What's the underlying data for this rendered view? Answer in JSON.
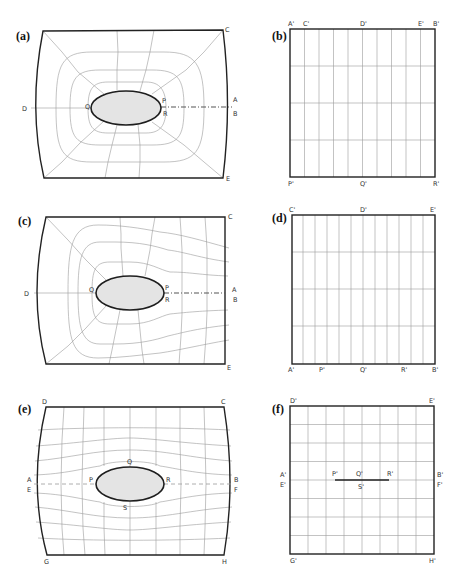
{
  "figure": {
    "panels": [
      {
        "id": "a",
        "label": "(a)",
        "type": "physical-domain",
        "points": {
          "C": "C",
          "D": "D",
          "A": "A",
          "B": "B",
          "E": "E",
          "P": "P",
          "Q": "Q",
          "R": "R"
        }
      },
      {
        "id": "b",
        "label": "(b)",
        "type": "computational-domain",
        "points": {
          "A": "A'",
          "C": "C'",
          "D": "D'",
          "E": "E'",
          "B": "B'",
          "P": "P'",
          "Q": "Q'",
          "R": "R'"
        },
        "grid": {
          "columns": 10,
          "rows": 4
        }
      },
      {
        "id": "c",
        "label": "(c)",
        "type": "physical-domain",
        "points": {
          "C": "C",
          "D": "D",
          "A": "A",
          "B": "B",
          "E": "E",
          "P": "P",
          "Q": "Q",
          "R": "R"
        }
      },
      {
        "id": "d",
        "label": "(d)",
        "type": "computational-domain",
        "points": {
          "C": "C'",
          "D": "D'",
          "E": "E'",
          "A": "A'",
          "P": "P'",
          "Q": "Q'",
          "R": "R'",
          "B": "B'"
        },
        "grid": {
          "columns": 12,
          "rows": 4
        }
      },
      {
        "id": "e",
        "label": "(e)",
        "type": "physical-domain",
        "points": {
          "D": "D",
          "C": "C",
          "A": "A",
          "E": "E",
          "B": "B",
          "F": "F",
          "P": "P",
          "Q": "Q",
          "R": "R",
          "S": "S",
          "G": "G",
          "H": "H"
        }
      },
      {
        "id": "f",
        "label": "(f)",
        "type": "computational-domain",
        "points": {
          "D": "D'",
          "E": "E'",
          "A": "A'",
          "E2": "E'",
          "B": "B'",
          "F": "F'",
          "P": "P'",
          "Q": "Q'",
          "R": "R'",
          "S": "S'",
          "G": "G'",
          "H": "H'"
        },
        "grid": {
          "columns": 8,
          "rows": 8
        }
      }
    ]
  }
}
